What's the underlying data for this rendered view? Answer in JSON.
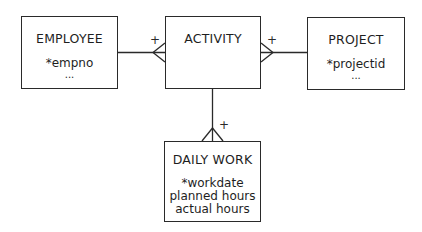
{
  "diagram": {
    "type": "entity-relationship",
    "entities": [
      {
        "id": "employee",
        "name": "EMPLOYEE",
        "attributes": [
          "*empno",
          "..."
        ]
      },
      {
        "id": "activity",
        "name": "ACTIVITY",
        "attributes": []
      },
      {
        "id": "project",
        "name": "PROJECT",
        "attributes": [
          "*projectid",
          "..."
        ]
      },
      {
        "id": "dailywork",
        "name": "DAILY WORK",
        "attributes": [
          "*workdate",
          "planned hours",
          "actual hours"
        ]
      }
    ],
    "relationships": [
      {
        "from": "employee",
        "to": "activity",
        "cardinality_at_to": "many",
        "label": "+"
      },
      {
        "from": "project",
        "to": "activity",
        "cardinality_at_to": "many",
        "label": "+"
      },
      {
        "from": "activity",
        "to": "dailywork",
        "cardinality_at_to": "many",
        "label": "+"
      }
    ]
  },
  "labels": {
    "employee_title": "EMPLOYEE",
    "employee_attr1": "*empno",
    "employee_more": "...",
    "activity_title": "ACTIVITY",
    "project_title": "PROJECT",
    "project_attr1": "*projectid",
    "project_more": "...",
    "dailywork_title": "DAILY WORK",
    "dailywork_attr1": "*workdate",
    "dailywork_attr2": "planned hours",
    "dailywork_attr3": "actual hours",
    "plus": "+"
  }
}
